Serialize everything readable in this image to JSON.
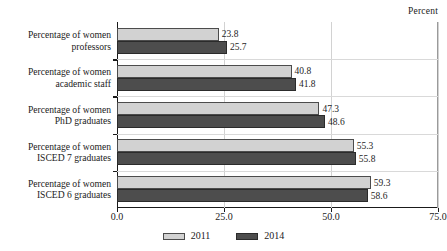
{
  "chart_data": {
    "type": "bar",
    "orientation": "horizontal",
    "title": "",
    "unit_caption": "Percent",
    "xlabel": "",
    "ylabel": "",
    "xlim": [
      0.0,
      75.0
    ],
    "xticks": [
      "0.0",
      "25.0",
      "50.0",
      "75.0"
    ],
    "xtick_values": [
      0.0,
      25.0,
      50.0,
      75.0
    ],
    "grid": {
      "vertical": true,
      "horizontal": true
    },
    "legend": {
      "position": "bottom-center",
      "entries": [
        {
          "name": "2011",
          "color": "#d2d2d2"
        },
        {
          "name": "2014",
          "color": "#4d4d4d"
        }
      ]
    },
    "categories": [
      {
        "line1": "Percentage of women",
        "line2": "professors"
      },
      {
        "line1": "Percentage of women",
        "line2": "academic staff"
      },
      {
        "line1": "Percentage of women",
        "line2": "PhD graduates"
      },
      {
        "line1": "Percentage of women",
        "line2": "ISCED 7 graduates"
      },
      {
        "line1": "Percentage of women",
        "line2": "ISCED 6 graduates"
      }
    ],
    "series": [
      {
        "name": "2011",
        "color": "#d2d2d2",
        "values": [
          23.8,
          40.8,
          47.3,
          55.3,
          59.3
        ],
        "labels": [
          "23.8",
          "40.8",
          "47.3",
          "55.3",
          "59.3"
        ]
      },
      {
        "name": "2014",
        "color": "#4d4d4d",
        "values": [
          25.7,
          41.8,
          48.6,
          55.8,
          58.6
        ],
        "labels": [
          "25.7",
          "41.8",
          "48.6",
          "55.8",
          "58.6"
        ]
      }
    ]
  }
}
